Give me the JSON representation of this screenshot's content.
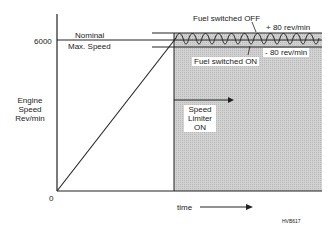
{
  "diagram": {
    "y_axis": {
      "label_lines": [
        "Engine",
        "Speed",
        "Rev/min"
      ],
      "ticks": [
        {
          "value": "6000"
        },
        {
          "value": "0"
        }
      ]
    },
    "x_axis": {
      "label": "time"
    },
    "annotations": {
      "nominal_line1": "Nominal",
      "nominal_line2": "Max. Speed",
      "fuel_off": "Fuel switched OFF",
      "fuel_on": "Fuel switched ON",
      "plus_band": "+ 80 rev/min",
      "minus_band": "- 80  rev/min",
      "limiter_line1": "Speed",
      "limiter_line2": "Limiter",
      "limiter_line3": "ON",
      "figure_code": "HVB617"
    },
    "colors": {
      "line": "#222222",
      "shade": "#c9c9c9",
      "background": "#ffffff"
    }
  }
}
